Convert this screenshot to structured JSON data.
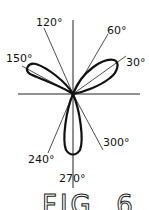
{
  "figure": {
    "caption": "FIG. 6",
    "type": "polar rose plot (three petals)",
    "petal_directions_deg": [
      30,
      150,
      270
    ],
    "angle_labels": [
      {
        "text": "30°",
        "angle": 30
      },
      {
        "text": "60°",
        "angle": 60
      },
      {
        "text": "120°",
        "angle": 120
      },
      {
        "text": "150°",
        "angle": 150
      },
      {
        "text": "240°",
        "angle": 240
      },
      {
        "text": "270°",
        "angle": 270
      },
      {
        "text": "300°",
        "angle": 300
      }
    ],
    "colors": {
      "ink": "#111111",
      "background": "#ffffff"
    }
  }
}
